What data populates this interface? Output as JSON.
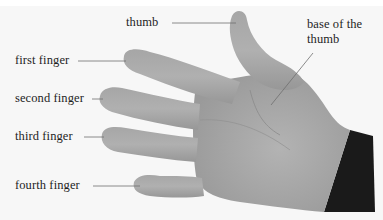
{
  "figure": {
    "background_color": "#f7f7f7",
    "skin_color": "#a9a9a9",
    "sleeve_color": "#1a1a1a",
    "leader_color": "#6e6e6e"
  },
  "labels": {
    "thumb": "thumb",
    "base_of_thumb_line1": "base of the",
    "base_of_thumb_line2": "thumb",
    "first_finger": "first finger",
    "second_finger": "second finger",
    "third_finger": "third finger",
    "fourth_finger": "fourth finger"
  }
}
